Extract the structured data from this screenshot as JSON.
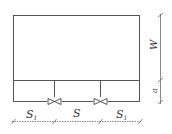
{
  "diagram": {
    "labels": {
      "side_spacing_left": "S",
      "side_spacing_left_sub": "1",
      "middle_spacing": "S",
      "side_spacing_right": "S",
      "side_spacing_right_sub": "1",
      "width": "W",
      "offset": "a"
    },
    "valves": [
      {
        "name": "valve-left",
        "symbol": "butterfly-valve"
      },
      {
        "name": "valve-right",
        "symbol": "butterfly-valve"
      }
    ]
  }
}
